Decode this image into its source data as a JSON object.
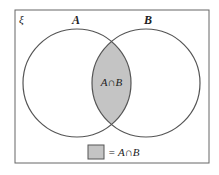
{
  "diagram": {
    "type": "venn",
    "universal_set_symbol": "ξ",
    "sets": [
      {
        "label": "A"
      },
      {
        "label": "B"
      }
    ],
    "intersection_label": "A∩B",
    "legend": {
      "text": "= A∩B"
    },
    "colors": {
      "outline": "#555555",
      "shade": "#c4c4c4",
      "frame": "#666666"
    }
  }
}
